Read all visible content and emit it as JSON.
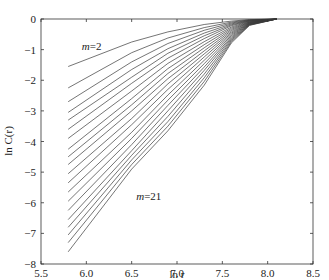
{
  "chart_data": {
    "type": "line",
    "title": "",
    "xlabel": "ln r",
    "ylabel": "ln C(r)",
    "xlim": [
      5.5,
      8.5
    ],
    "ylim": [
      -8,
      0
    ],
    "grid": false,
    "legend": "none",
    "xticks": [
      5.5,
      6.0,
      6.5,
      7.0,
      7.5,
      8.0,
      8.5
    ],
    "xtick_labels": [
      "5.5",
      "6.0",
      "6.5",
      "7.0",
      "7.5",
      "8.0",
      "8.5"
    ],
    "yticks": [
      0,
      -1,
      -2,
      -3,
      -4,
      -5,
      -6,
      -7,
      -8
    ],
    "ytick_labels": [
      "0",
      "-1",
      "-2",
      "-3",
      "-4",
      "-5",
      "-6",
      "-7",
      "-8"
    ],
    "annotations": [
      {
        "text": "m=2",
        "x": 5.95,
        "y": -1.0
      },
      {
        "text": "m=21",
        "x": 6.55,
        "y": -5.9
      }
    ],
    "x": [
      5.8,
      6.5,
      6.9,
      7.3,
      7.6,
      7.8,
      8.1
    ],
    "series": [
      {
        "name": "m=2",
        "values": [
          -1.55,
          -0.75,
          -0.42,
          -0.18,
          -0.07,
          -0.02,
          0
        ]
      },
      {
        "name": "m=3",
        "values": [
          -2.25,
          -1.1,
          -0.62,
          -0.28,
          -0.1,
          -0.03,
          0
        ]
      },
      {
        "name": "m=4",
        "values": [
          -2.7,
          -1.4,
          -0.8,
          -0.37,
          -0.13,
          -0.04,
          0
        ]
      },
      {
        "name": "m=5",
        "values": [
          -3.05,
          -1.65,
          -0.97,
          -0.46,
          -0.16,
          -0.05,
          0
        ]
      },
      {
        "name": "m=6",
        "values": [
          -3.3,
          -1.9,
          -1.12,
          -0.55,
          -0.19,
          -0.06,
          0
        ]
      },
      {
        "name": "m=7",
        "values": [
          -3.6,
          -2.1,
          -1.28,
          -0.64,
          -0.22,
          -0.07,
          0
        ]
      },
      {
        "name": "m=8",
        "values": [
          -3.9,
          -2.35,
          -1.45,
          -0.74,
          -0.26,
          -0.08,
          0
        ]
      },
      {
        "name": "m=9",
        "values": [
          -4.25,
          -2.6,
          -1.62,
          -0.84,
          -0.3,
          -0.09,
          0
        ]
      },
      {
        "name": "m=10",
        "values": [
          -4.5,
          -2.8,
          -1.78,
          -0.94,
          -0.34,
          -0.1,
          0
        ]
      },
      {
        "name": "m=11",
        "values": [
          -4.75,
          -3.0,
          -1.95,
          -1.04,
          -0.38,
          -0.11,
          0
        ]
      },
      {
        "name": "m=12",
        "values": [
          -5.05,
          -3.25,
          -2.12,
          -1.14,
          -0.42,
          -0.12,
          0
        ]
      },
      {
        "name": "m=13",
        "values": [
          -5.35,
          -3.45,
          -2.3,
          -1.24,
          -0.46,
          -0.13,
          0
        ]
      },
      {
        "name": "m=14",
        "values": [
          -5.65,
          -3.7,
          -2.48,
          -1.35,
          -0.5,
          -0.14,
          0
        ]
      },
      {
        "name": "m=15",
        "values": [
          -5.95,
          -3.9,
          -2.65,
          -1.46,
          -0.54,
          -0.15,
          0
        ]
      },
      {
        "name": "m=16",
        "values": [
          -6.25,
          -4.1,
          -2.82,
          -1.57,
          -0.58,
          -0.16,
          0
        ]
      },
      {
        "name": "m=17",
        "values": [
          -6.55,
          -4.3,
          -3.0,
          -1.68,
          -0.62,
          -0.17,
          0
        ]
      },
      {
        "name": "m=18",
        "values": [
          -6.8,
          -4.45,
          -3.18,
          -1.8,
          -0.66,
          -0.18,
          0
        ]
      },
      {
        "name": "m=19",
        "values": [
          -7.05,
          -4.6,
          -3.35,
          -1.92,
          -0.7,
          -0.19,
          0
        ]
      },
      {
        "name": "m=20",
        "values": [
          -7.3,
          -4.75,
          -3.5,
          -2.04,
          -0.74,
          -0.2,
          0
        ]
      },
      {
        "name": "m=21",
        "values": [
          -7.6,
          -4.9,
          -3.65,
          -2.16,
          -0.78,
          -0.21,
          0
        ]
      }
    ]
  },
  "colors": {
    "line": "#3a3a3a",
    "axis": "#333333",
    "background": "#ffffff"
  }
}
